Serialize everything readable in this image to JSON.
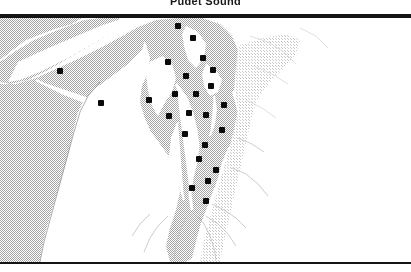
{
  "figure": {
    "title_fragment": "Puget Sound",
    "width": 411,
    "height": 272,
    "background_color": "#ffffff",
    "rule_color": "#141414"
  },
  "map": {
    "region_name": "Puget Sound, Washington",
    "style": "grayscale dithered halftone reference map",
    "land_color": "#b8b8b8",
    "water_color": "#ffffff",
    "highland_color": "#d8d8d8",
    "marker_color": "#0a0a0a",
    "marker_shape": "filled-square-dot",
    "marker_count": 24,
    "has_labels": false,
    "has_graticule": false,
    "has_scalebar": false,
    "has_legend": false
  },
  "chart_data": {
    "type": "scatter",
    "title": "Puget Sound",
    "xlabel": "",
    "ylabel": "",
    "xlim": [
      0,
      411
    ],
    "ylim": [
      0,
      244
    ],
    "grid": false,
    "legend": "none",
    "series": [
      {
        "name": "sample-sites",
        "marker": "square",
        "color": "#0a0a0a",
        "points": [
          {
            "x": 178,
            "y": 8
          },
          {
            "x": 193,
            "y": 20
          },
          {
            "x": 60,
            "y": 53
          },
          {
            "x": 168,
            "y": 44
          },
          {
            "x": 203,
            "y": 40
          },
          {
            "x": 213,
            "y": 52
          },
          {
            "x": 186,
            "y": 58
          },
          {
            "x": 101,
            "y": 85
          },
          {
            "x": 149,
            "y": 82
          },
          {
            "x": 175,
            "y": 76
          },
          {
            "x": 196,
            "y": 76
          },
          {
            "x": 211,
            "y": 68
          },
          {
            "x": 224,
            "y": 87
          },
          {
            "x": 169,
            "y": 98
          },
          {
            "x": 189,
            "y": 95
          },
          {
            "x": 206,
            "y": 97
          },
          {
            "x": 222,
            "y": 112
          },
          {
            "x": 185,
            "y": 116
          },
          {
            "x": 205,
            "y": 127
          },
          {
            "x": 199,
            "y": 141
          },
          {
            "x": 216,
            "y": 152
          },
          {
            "x": 208,
            "y": 163
          },
          {
            "x": 192,
            "y": 170
          },
          {
            "x": 206,
            "y": 183
          }
        ]
      }
    ]
  }
}
